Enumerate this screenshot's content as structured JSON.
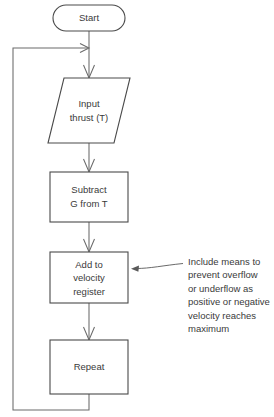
{
  "diagram": {
    "background_color": "#ffffff",
    "line_color": "#6a6a6a",
    "shape_stroke_color": "#4a4a4a",
    "text_color": "#3a3a3a"
  },
  "nodes": {
    "start": {
      "shape": "rounded-terminator",
      "label": "Start",
      "lines": [
        "Start"
      ]
    },
    "input_thrust": {
      "shape": "parallelogram",
      "label": "Input thrust (T)",
      "lines": [
        "Input",
        "thrust (T)"
      ]
    },
    "subtract": {
      "shape": "rectangle",
      "label": "Subtract G from T",
      "lines": [
        "Subtract",
        "G from T"
      ]
    },
    "add_velocity": {
      "shape": "rectangle",
      "label": "Add to velocity register",
      "lines": [
        "Add to",
        "velocity",
        "register"
      ]
    },
    "repeat": {
      "shape": "rectangle",
      "label": "Repeat",
      "lines": [
        "Repeat"
      ]
    }
  },
  "annotation": {
    "target": "add_velocity",
    "text": "Include means to prevent overflow or underflow as positive or negative velocity reaches maximum",
    "lines": [
      "Include means to",
      "prevent overflow",
      "or underflow as",
      "positive or negative",
      "velocity reaches",
      "maximum"
    ]
  },
  "connectors": [
    {
      "name": "start-to-input",
      "from": "start",
      "to": "input_thrust",
      "arrow": true
    },
    {
      "name": "input-to-subtract",
      "from": "input_thrust",
      "to": "subtract",
      "arrow": true
    },
    {
      "name": "subtract-to-add",
      "from": "subtract",
      "to": "add_velocity",
      "arrow": true
    },
    {
      "name": "add-to-repeat",
      "from": "add_velocity",
      "to": "repeat",
      "arrow": true
    },
    {
      "name": "repeat-loopback",
      "from": "repeat",
      "to": "input_thrust",
      "arrow": true
    }
  ]
}
